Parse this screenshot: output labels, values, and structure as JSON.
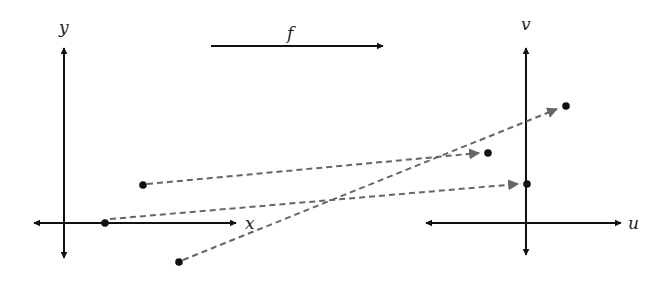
{
  "colors": {
    "axis": "#111111",
    "point": "#111111",
    "mapping_arrow": "#666666",
    "label": "#222222",
    "background": "#ffffff"
  },
  "domain_plane": {
    "x_axis_label": "x",
    "y_axis_label": "y",
    "points": [
      {
        "name": "point-on-x-axis",
        "cx": 105,
        "cy": 223
      },
      {
        "name": "point-upper",
        "cx": 143,
        "cy": 185
      },
      {
        "name": "point-lower",
        "cx": 179,
        "cy": 262
      }
    ]
  },
  "function_arrow": {
    "label": "f"
  },
  "codomain_plane": {
    "u_axis_label": "u",
    "v_axis_label": "v",
    "points": [
      {
        "name": "image-point-left",
        "cx": 488,
        "cy": 153
      },
      {
        "name": "image-point-on-v-axis",
        "cx": 527,
        "cy": 184
      },
      {
        "name": "image-point-upper-right",
        "cx": 566,
        "cy": 106
      }
    ]
  },
  "mappings": [
    {
      "from": "point-upper",
      "to": "image-point-left"
    },
    {
      "from": "point-on-x-axis",
      "to": "image-point-on-v-axis"
    },
    {
      "from": "point-lower",
      "to": "image-point-upper-right"
    }
  ]
}
